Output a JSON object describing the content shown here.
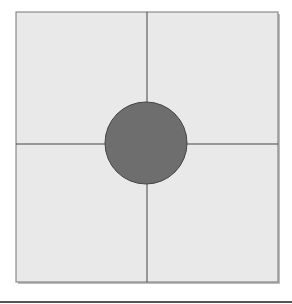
{
  "diagram": {
    "square": {
      "x": 16,
      "y": 12,
      "width": 262,
      "height": 270,
      "fill": "#e9e9e9",
      "stroke": "#777777"
    },
    "divider_x": 147,
    "divider_y": 144,
    "circle": {
      "cx": 146,
      "cy": 143,
      "r": 41,
      "fill": "#6e6e6e",
      "stroke": "#444444"
    },
    "line_color": "#444444",
    "bottom_rule_color": "#555555"
  }
}
